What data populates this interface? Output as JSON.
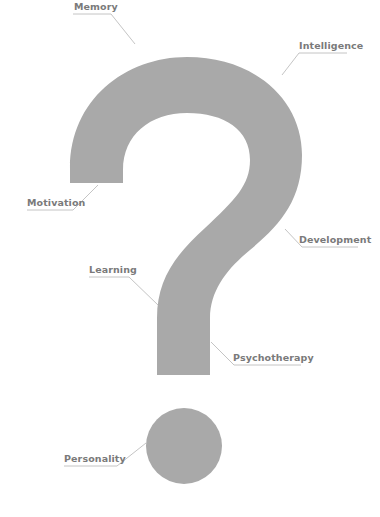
{
  "figure": {
    "shape": "question-mark",
    "colors": {
      "shape": "#a9a9a9",
      "leader_line": "#b5b5b5",
      "label_text": "#7a7a7a",
      "background": "#ffffff"
    }
  },
  "labels": [
    {
      "id": "memory",
      "text": "Memory"
    },
    {
      "id": "intelligence",
      "text": "Intelligence"
    },
    {
      "id": "motivation",
      "text": "Motivation"
    },
    {
      "id": "development",
      "text": "Development"
    },
    {
      "id": "learning",
      "text": "Learning"
    },
    {
      "id": "psychotherapy",
      "text": "Psychotherapy"
    },
    {
      "id": "personality",
      "text": "Personality"
    }
  ]
}
